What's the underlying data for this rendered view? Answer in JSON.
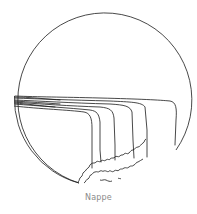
{
  "diagram": {
    "caption": "Nappe",
    "colors": {
      "line": "#1a1a1a",
      "caption": "#8a8a8a",
      "background": "#ffffff"
    }
  }
}
